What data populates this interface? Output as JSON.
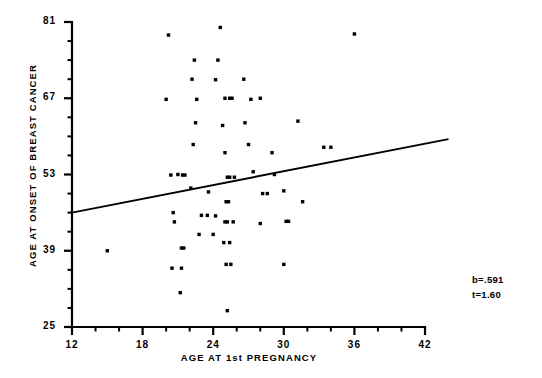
{
  "chart_data": {
    "type": "scatter",
    "title": "",
    "xlabel": "AGE AT 1st PREGNANCY",
    "ylabel": "AGE AT ONSET OF BREAST CANCER",
    "xlim": [
      12,
      42
    ],
    "ylim": [
      25,
      81
    ],
    "xticks": [
      12,
      18,
      24,
      30,
      36,
      42
    ],
    "yticks": [
      25,
      39,
      53,
      67,
      81
    ],
    "xtick_labels": [
      "12",
      "18",
      "24",
      "30",
      "36",
      "42"
    ],
    "ytick_labels": [
      "25",
      "39",
      "53",
      "67",
      "81"
    ],
    "x_minor_tick_step": 2,
    "y_minor_tick_step": 3.5,
    "grid": false,
    "legend": null,
    "marker": "square-dot",
    "marker_color": "#000000",
    "points": [
      [
        15.0,
        39.0
      ],
      [
        20.2,
        78.6
      ],
      [
        20.0,
        66.8
      ],
      [
        20.4,
        52.9
      ],
      [
        21.0,
        53.0
      ],
      [
        21.4,
        52.9
      ],
      [
        21.6,
        52.9
      ],
      [
        20.6,
        46.0
      ],
      [
        21.3,
        39.5
      ],
      [
        21.5,
        39.5
      ],
      [
        20.7,
        44.3
      ],
      [
        20.5,
        35.8
      ],
      [
        21.3,
        35.8
      ],
      [
        21.2,
        31.3
      ],
      [
        22.4,
        74.0
      ],
      [
        22.2,
        70.5
      ],
      [
        22.6,
        66.8
      ],
      [
        22.5,
        62.5
      ],
      [
        22.3,
        58.5
      ],
      [
        22.1,
        50.5
      ],
      [
        23.0,
        45.5
      ],
      [
        23.5,
        45.5
      ],
      [
        22.8,
        42.0
      ],
      [
        24.0,
        42.0
      ],
      [
        24.2,
        45.4
      ],
      [
        23.6,
        49.8
      ],
      [
        24.6,
        80.0
      ],
      [
        24.4,
        74.0
      ],
      [
        24.2,
        70.4
      ],
      [
        25.0,
        67.0
      ],
      [
        25.4,
        67.0
      ],
      [
        25.6,
        67.0
      ],
      [
        24.8,
        62.0
      ],
      [
        25.0,
        57.0
      ],
      [
        25.2,
        52.5
      ],
      [
        25.4,
        52.5
      ],
      [
        25.8,
        52.5
      ],
      [
        25.1,
        48.0
      ],
      [
        25.3,
        48.0
      ],
      [
        25.0,
        44.3
      ],
      [
        25.2,
        44.3
      ],
      [
        25.7,
        44.3
      ],
      [
        24.9,
        40.5
      ],
      [
        25.4,
        40.5
      ],
      [
        25.1,
        36.5
      ],
      [
        25.5,
        36.5
      ],
      [
        25.2,
        28.0
      ],
      [
        26.6,
        70.5
      ],
      [
        26.7,
        62.5
      ],
      [
        27.2,
        66.8
      ],
      [
        27.0,
        58.5
      ],
      [
        27.4,
        53.5
      ],
      [
        28.0,
        67.0
      ],
      [
        28.2,
        49.5
      ],
      [
        28.6,
        49.5
      ],
      [
        28.0,
        44.0
      ],
      [
        29.0,
        57.0
      ],
      [
        29.2,
        53.0
      ],
      [
        30.0,
        50.0
      ],
      [
        30.2,
        44.4
      ],
      [
        30.4,
        44.4
      ],
      [
        30.0,
        36.5
      ],
      [
        31.2,
        62.8
      ],
      [
        31.6,
        48.0
      ],
      [
        33.4,
        58.0
      ],
      [
        34.0,
        58.0
      ],
      [
        36.0,
        78.8
      ]
    ],
    "regression_line": {
      "slope": 0.591,
      "x_start": 12,
      "y_start": 46.0,
      "x_end": 44,
      "y_end": 59.5
    },
    "annotations": {
      "slope_label": "b=.591",
      "tstat_label": "t=1.60"
    }
  }
}
